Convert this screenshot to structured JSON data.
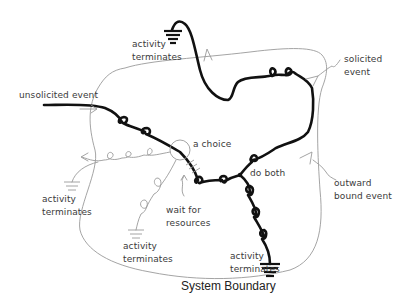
{
  "diagram": {
    "title": "System Boundary",
    "labels": {
      "unsolicited_event": "unsolicited event",
      "solicited_event_1": "solicited",
      "solicited_event_2": "event",
      "a_choice": "a choice",
      "do_both": "do both",
      "outward_bound_1": "outward",
      "outward_bound_2": "bound event",
      "wait_for_1": "wait for",
      "wait_for_2": "resources",
      "term_top_1": "activity",
      "term_top_2": "terminates",
      "term_left_1": "activity",
      "term_left_2": "terminates",
      "term_midleft_1": "activity",
      "term_midleft_2": "terminates",
      "term_bottom_1": "activity",
      "term_bottom_2": "terminates"
    },
    "colors": {
      "main_thread": "#111111",
      "secondary_thread": "#9a9a9a",
      "text": "#3a3a3a"
    }
  }
}
